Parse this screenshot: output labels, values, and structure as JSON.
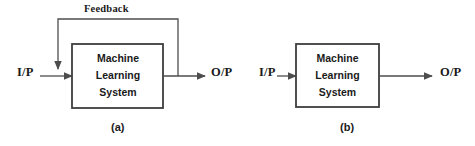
{
  "figure": {
    "background_color": "#ffffff",
    "line_color": "#4d4d4d",
    "box_border_color": "#3d3d3d",
    "text_color": "#1a1a1a",
    "width": 475,
    "height": 146
  },
  "diagram_a": {
    "caption": "(a)",
    "input_label": "I/P",
    "output_label": "O/P",
    "feedback_label": "Feedback",
    "box_line_1": "Machine",
    "box_line_2": "Learning",
    "box_line_3": "System",
    "has_feedback_loop": true
  },
  "diagram_b": {
    "caption": "(b)",
    "input_label": "I/P",
    "output_label": "O/P",
    "box_line_1": "Machine",
    "box_line_2": "Learning",
    "box_line_3": "System",
    "has_feedback_loop": false
  }
}
